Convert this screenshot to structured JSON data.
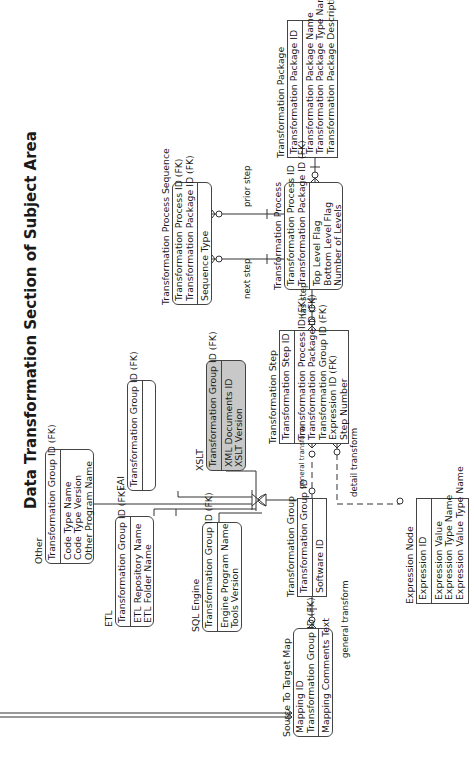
{
  "title": "Data Transformation Section of Subject Area",
  "entities": {
    "transformation_package": {
      "name": "Transformation Package",
      "pk": [
        "Transformation Package ID"
      ],
      "attrs": [
        "Transformation Package Name",
        "Transformation Package Type Name",
        "Transformation Package Description"
      ]
    },
    "transformation_process": {
      "name": "Transformation Process",
      "pk": [
        "Transformation Process ID",
        "Transformation Package ID (FK)"
      ],
      "attrs": [
        "Top Level Flag",
        "Bottom Level Flag",
        "Number of Levels"
      ]
    },
    "transformation_process_sequence": {
      "name": "Transformation Process Sequence",
      "pk": [
        "Transformation Process ID (FK)",
        "Transformation Package ID (FK)"
      ],
      "attrs": [
        "Sequence Type"
      ]
    },
    "transformation_step": {
      "name": "Transformation Step",
      "pk": [
        "Transformation Step ID"
      ],
      "attrs": [
        "Transformation Process ID (FK)",
        "Transformation Package ID (FK)",
        "Transformation Group ID (FK)",
        "Expression ID (FK)",
        "Step Number"
      ]
    },
    "xslt": {
      "name": "XSLT",
      "pk": [
        "Transformation Group ID (FK)"
      ],
      "attrs": [
        "XML Documents ID",
        "XSLT Version"
      ]
    },
    "eai": {
      "name": "EAI",
      "pk": [
        "Transformation Group ID (FK)"
      ],
      "attrs": []
    },
    "other": {
      "name": "Other",
      "pk": [
        "Transformation Group ID (FK)"
      ],
      "attrs": [
        "Code Type Name",
        "Code Type Version",
        "Other Program Name"
      ]
    },
    "etl": {
      "name": "ETL",
      "pk": [
        "Transformation Group ID (FK)"
      ],
      "attrs": [
        "ETL Repository Name",
        "ETL Folder Name"
      ]
    },
    "sql_engine": {
      "name": "SQL Engine",
      "pk": [
        "Transformation Group ID (FK)"
      ],
      "attrs": [
        "Engine Program Name",
        "Tools Version"
      ]
    },
    "transformation_group": {
      "name": "Transformation Group",
      "pk": [
        "Transformation Group ID"
      ],
      "attrs": [
        "Software ID"
      ]
    },
    "source_to_target_map": {
      "name": "Source To Target Map",
      "pk": [
        "Mapping ID",
        "Transformation Group ID (FK)"
      ],
      "attrs": [
        "Mapping Comments Text"
      ]
    },
    "expression_node": {
      "name": "Expression Node",
      "pk": [
        "Expression ID"
      ],
      "attrs": [
        "Expression Value",
        "Expression Type Name",
        "Expression Value Type Name"
      ]
    }
  },
  "relationships": {
    "prior_step": "prior step",
    "next_step": "next step",
    "has_step": "has step",
    "general_transform_step": "general transform",
    "general_transform_map": "general transform",
    "detail_transform": "detail transform"
  }
}
